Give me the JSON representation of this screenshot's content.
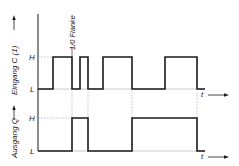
{
  "diagram": {
    "title": "",
    "top_panel": {
      "ylabel": "Eingang C (1)",
      "level_high": "H",
      "level_low": "L",
      "time_label": "t",
      "annotation": "1/0 Flanke",
      "edges_x": [
        53,
        72,
        80,
        88,
        103,
        132,
        165,
        197
      ]
    },
    "bottom_panel": {
      "ylabel": "Ausgang Q",
      "level_high": "H",
      "level_low": "L",
      "time_label": "t",
      "edges_x": [
        72,
        88,
        132,
        197
      ]
    },
    "colors": {
      "signal": "#1a1a1a",
      "guide": "#999999",
      "background": "#ffffff"
    }
  }
}
